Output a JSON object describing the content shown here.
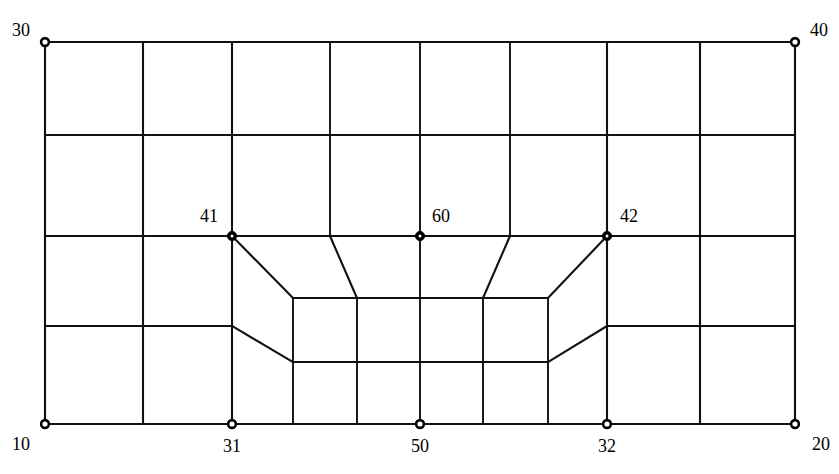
{
  "figure": {
    "name": "finite-element-mesh-diagram",
    "type": "mesh-diagram",
    "background_color": "#ffffff",
    "line_color": "#111111",
    "node_fill_color": "#ffffff",
    "node_stroke_color": "#000000",
    "width": 839,
    "height": 474
  },
  "nodes": [
    {
      "id": "30",
      "label": "30",
      "x": 45,
      "y": 42,
      "label_x": 30,
      "label_y": 36,
      "anchor": "end",
      "style": "ring"
    },
    {
      "id": "40",
      "label": "40",
      "x": 795,
      "y": 42,
      "label_x": 810,
      "label_y": 36,
      "anchor": "start",
      "style": "ring"
    },
    {
      "id": "41",
      "label": "41",
      "x": 232,
      "y": 236,
      "label_x": 218,
      "label_y": 222,
      "anchor": "end",
      "style": "dot"
    },
    {
      "id": "60",
      "label": "60",
      "x": 420,
      "y": 236,
      "label_x": 432,
      "label_y": 222,
      "anchor": "start",
      "style": "dot"
    },
    {
      "id": "42",
      "label": "42",
      "x": 607,
      "y": 236,
      "label_x": 620,
      "label_y": 222,
      "anchor": "start",
      "style": "dot"
    },
    {
      "id": "10",
      "label": "10",
      "x": 45,
      "y": 424,
      "label_x": 30,
      "label_y": 450,
      "anchor": "end",
      "style": "ring"
    },
    {
      "id": "31",
      "label": "31",
      "x": 232,
      "y": 424,
      "label_x": 232,
      "label_y": 452,
      "anchor": "middle",
      "style": "ring"
    },
    {
      "id": "50",
      "label": "50",
      "x": 420,
      "y": 424,
      "label_x": 420,
      "label_y": 452,
      "anchor": "middle",
      "style": "ring"
    },
    {
      "id": "32",
      "label": "32",
      "x": 607,
      "y": 424,
      "label_x": 607,
      "label_y": 452,
      "anchor": "middle",
      "style": "ring"
    },
    {
      "id": "20",
      "label": "20",
      "x": 795,
      "y": 424,
      "label_x": 812,
      "label_y": 450,
      "anchor": "start",
      "style": "ring"
    }
  ],
  "geometry": {
    "rows_y": [
      42,
      135,
      236,
      326,
      424
    ],
    "coarse_columns_x": [
      45,
      143,
      232,
      330,
      420,
      510,
      607,
      700,
      795
    ],
    "refined_columns_x": [
      293,
      357,
      420,
      483,
      548
    ],
    "refined_band_top_y": 298,
    "refined_band_bottom_y": 362,
    "mid_band_left_x": 293,
    "mid_band_right_x": 548
  },
  "edges": {
    "horizontals": [
      {
        "name": "top-border",
        "x1": 45,
        "y1": 42,
        "x2": 795,
        "y2": 42
      },
      {
        "name": "row1-row2-divider",
        "x1": 45,
        "y1": 135,
        "x2": 795,
        "y2": 135
      },
      {
        "name": "row2-row3-divider",
        "x1": 45,
        "y1": 236,
        "x2": 795,
        "y2": 236
      },
      {
        "name": "bottom-border",
        "x1": 45,
        "y1": 424,
        "x2": 795,
        "y2": 424
      },
      {
        "name": "row3-left-shelf",
        "x1": 45,
        "y1": 326,
        "x2": 232,
        "y2": 326
      },
      {
        "name": "row3-right-shelf",
        "x1": 607,
        "y1": 326,
        "x2": 795,
        "y2": 326
      },
      {
        "name": "refined-top",
        "x1": 293,
        "y1": 298,
        "x2": 548,
        "y2": 298
      },
      {
        "name": "refined-bottom",
        "x1": 293,
        "y1": 362,
        "x2": 548,
        "y2": 362
      }
    ],
    "verticals_full": [
      {
        "name": "left-border",
        "x": 45,
        "y1": 42,
        "y2": 424
      },
      {
        "name": "right-border",
        "x": 795,
        "y1": 42,
        "y2": 424
      },
      {
        "name": "col-143",
        "x": 143,
        "y1": 42,
        "y2": 424
      },
      {
        "name": "col-232",
        "x": 232,
        "y1": 42,
        "y2": 424
      },
      {
        "name": "col-700",
        "x": 700,
        "y1": 42,
        "y2": 424
      },
      {
        "name": "col-607",
        "x": 607,
        "y1": 42,
        "y2": 424
      }
    ],
    "verticals_upper": [
      {
        "name": "col-330-upper",
        "x": 330,
        "y1": 42,
        "y2": 236
      },
      {
        "name": "col-420-upper",
        "x": 420,
        "y1": 42,
        "y2": 236
      },
      {
        "name": "col-510-upper",
        "x": 510,
        "y1": 42,
        "y2": 236
      }
    ],
    "verticals_refined": [
      {
        "name": "refined-col-293",
        "x": 293,
        "y1": 298,
        "y2": 424
      },
      {
        "name": "refined-col-357",
        "x": 357,
        "y1": 298,
        "y2": 424
      },
      {
        "name": "refined-col-420",
        "x": 420,
        "y1": 298,
        "y2": 424
      },
      {
        "name": "refined-col-483",
        "x": 483,
        "y1": 298,
        "y2": 424
      },
      {
        "name": "refined-col-548",
        "x": 548,
        "y1": 298,
        "y2": 424
      }
    ],
    "diagonals": [
      {
        "name": "transition-41-to-refined-topleft",
        "x1": 232,
        "y1": 236,
        "x2": 293,
        "y2": 298
      },
      {
        "name": "transition-330-to-refined-357",
        "x1": 330,
        "y1": 236,
        "x2": 357,
        "y2": 298
      },
      {
        "name": "transition-510-to-refined-483",
        "x1": 510,
        "y1": 236,
        "x2": 483,
        "y2": 298
      },
      {
        "name": "transition-42-to-refined-topright",
        "x1": 607,
        "y1": 236,
        "x2": 548,
        "y2": 298
      },
      {
        "name": "transition-left-shelf-to-refined-bottom",
        "x1": 232,
        "y1": 326,
        "x2": 293,
        "y2": 362
      },
      {
        "name": "transition-right-shelf-to-refined-bottom",
        "x1": 607,
        "y1": 326,
        "x2": 548,
        "y2": 362
      }
    ],
    "segments_mid": [
      {
        "name": "refined-top-to-60-vertical",
        "x1": 420,
        "y1": 236,
        "x2": 420,
        "y2": 298
      }
    ]
  }
}
